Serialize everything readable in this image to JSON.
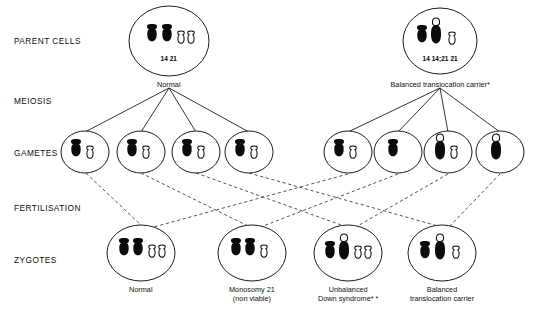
{
  "diagram": {
    "row_labels": [
      {
        "id": "parent-cells",
        "text": "PARENT CELLS",
        "x": 14,
        "y": 36
      },
      {
        "id": "meiosis",
        "text": "MEIOSIS",
        "x": 14,
        "y": 96
      },
      {
        "id": "gametes",
        "text": "GAMETES",
        "x": 14,
        "y": 148
      },
      {
        "id": "fertilisation",
        "text": "FERTILISATION",
        "x": 14,
        "y": 203
      },
      {
        "id": "zygotes",
        "text": "ZYGOTES",
        "x": 14,
        "y": 255
      }
    ],
    "parent_cells": [
      {
        "id": "parent-normal",
        "cx": 169,
        "cy": 41,
        "rx": 40,
        "ry": 35,
        "caption": "Normal",
        "caption_x": 169,
        "caption_y": 80,
        "chromosome_label": "14      21",
        "label_x": 169,
        "label_y": 55,
        "chromosomes": [
          {
            "type": "filled-14",
            "x": 152,
            "y": 24
          },
          {
            "type": "filled-14",
            "x": 167,
            "y": 24
          },
          {
            "type": "open-21",
            "x": 181,
            "y": 31
          },
          {
            "type": "open-21",
            "x": 191,
            "y": 31
          }
        ]
      },
      {
        "id": "parent-translocation-carrier",
        "cx": 440,
        "cy": 41,
        "rx": 37,
        "ry": 33,
        "caption": "Balanced translocation carrier*",
        "caption_x": 440,
        "caption_y": 80,
        "chromosome_label": "14 14;21 21",
        "label_x": 440,
        "label_y": 55,
        "chromosomes": [
          {
            "type": "filled-14",
            "x": 422,
            "y": 25
          },
          {
            "type": "translocation",
            "x": 436,
            "y": 18
          },
          {
            "type": "open-21",
            "x": 452,
            "y": 32
          }
        ]
      }
    ],
    "gametes": [
      {
        "id": "gamete-1",
        "cx": 85,
        "cy": 152,
        "rx": 24,
        "ry": 21,
        "chromosomes": [
          {
            "type": "filled-14",
            "x": 76,
            "y": 139
          },
          {
            "type": "open-21",
            "x": 90,
            "y": 146
          }
        ]
      },
      {
        "id": "gamete-2",
        "cx": 141,
        "cy": 152,
        "rx": 24,
        "ry": 21,
        "chromosomes": [
          {
            "type": "filled-14",
            "x": 132,
            "y": 139
          },
          {
            "type": "open-21",
            "x": 146,
            "y": 146
          }
        ]
      },
      {
        "id": "gamete-3",
        "cx": 196,
        "cy": 152,
        "rx": 24,
        "ry": 21,
        "chromosomes": [
          {
            "type": "filled-14",
            "x": 187,
            "y": 139
          },
          {
            "type": "open-21",
            "x": 201,
            "y": 146
          }
        ]
      },
      {
        "id": "gamete-4",
        "cx": 249,
        "cy": 152,
        "rx": 24,
        "ry": 21,
        "chromosomes": [
          {
            "type": "filled-14",
            "x": 240,
            "y": 139
          },
          {
            "type": "open-21",
            "x": 254,
            "y": 146
          }
        ]
      },
      {
        "id": "gamete-5",
        "cx": 348,
        "cy": 152,
        "rx": 24,
        "ry": 21,
        "chromosomes": [
          {
            "type": "filled-14",
            "x": 339,
            "y": 139
          },
          {
            "type": "open-21",
            "x": 353,
            "y": 146
          }
        ]
      },
      {
        "id": "gamete-6",
        "cx": 398,
        "cy": 152,
        "rx": 24,
        "ry": 21,
        "chromosomes": [
          {
            "type": "filled-14",
            "x": 393,
            "y": 139
          }
        ]
      },
      {
        "id": "gamete-7",
        "cx": 448,
        "cy": 152,
        "rx": 24,
        "ry": 21,
        "chromosomes": [
          {
            "type": "translocation",
            "x": 440,
            "y": 134
          },
          {
            "type": "open-21",
            "x": 454,
            "y": 146
          }
        ]
      },
      {
        "id": "gamete-8",
        "cx": 500,
        "cy": 152,
        "rx": 24,
        "ry": 21,
        "chromosomes": [
          {
            "type": "translocation",
            "x": 496,
            "y": 134
          }
        ]
      }
    ],
    "zygotes": [
      {
        "id": "zygote-normal",
        "cx": 141,
        "cy": 253,
        "rx": 34,
        "ry": 28,
        "caption": "Normal",
        "caption_x": 141,
        "caption_y": 285,
        "chromosomes": [
          {
            "type": "filled-14",
            "x": 124,
            "y": 238
          },
          {
            "type": "filled-14",
            "x": 138,
            "y": 238
          },
          {
            "type": "open-21",
            "x": 152,
            "y": 245
          },
          {
            "type": "open-21",
            "x": 162,
            "y": 245
          }
        ]
      },
      {
        "id": "zygote-monosomy-21",
        "cx": 252,
        "cy": 253,
        "rx": 34,
        "ry": 28,
        "caption": "Monosomy 21\n(non viable)",
        "caption_x": 252,
        "caption_y": 285,
        "chromosomes": [
          {
            "type": "filled-14",
            "x": 236,
            "y": 238
          },
          {
            "type": "filled-14",
            "x": 250,
            "y": 238
          },
          {
            "type": "open-21",
            "x": 264,
            "y": 245
          }
        ]
      },
      {
        "id": "zygote-unbalanced-down",
        "cx": 348,
        "cy": 253,
        "rx": 34,
        "ry": 28,
        "caption": "Unbalanced\nDown syndrome*  *",
        "caption_x": 348,
        "caption_y": 285,
        "chromosomes": [
          {
            "type": "filled-14",
            "x": 330,
            "y": 241
          },
          {
            "type": "translocation",
            "x": 344,
            "y": 234
          },
          {
            "type": "open-21",
            "x": 358,
            "y": 246
          },
          {
            "type": "open-21",
            "x": 368,
            "y": 246
          }
        ]
      },
      {
        "id": "zygote-balanced-carrier",
        "cx": 442,
        "cy": 253,
        "rx": 34,
        "ry": 28,
        "caption": "Balanced\ntranslocation carrier",
        "caption_x": 442,
        "caption_y": 285,
        "chromosomes": [
          {
            "type": "filled-14",
            "x": 425,
            "y": 241
          },
          {
            "type": "translocation",
            "x": 440,
            "y": 234
          },
          {
            "type": "open-21",
            "x": 456,
            "y": 246
          }
        ]
      }
    ],
    "meiosis_lines": [
      {
        "from": [
          169,
          88
        ],
        "to": [
          85,
          132
        ]
      },
      {
        "from": [
          169,
          88
        ],
        "to": [
          141,
          132
        ]
      },
      {
        "from": [
          169,
          88
        ],
        "to": [
          196,
          132
        ]
      },
      {
        "from": [
          169,
          88
        ],
        "to": [
          249,
          132
        ]
      },
      {
        "from": [
          440,
          88
        ],
        "to": [
          348,
          132
        ]
      },
      {
        "from": [
          440,
          88
        ],
        "to": [
          398,
          132
        ]
      },
      {
        "from": [
          440,
          88
        ],
        "to": [
          448,
          132
        ]
      },
      {
        "from": [
          440,
          88
        ],
        "to": [
          500,
          132
        ]
      }
    ],
    "fertilisation_lines": [
      {
        "from": [
          86,
          173
        ],
        "to": [
          142,
          226
        ],
        "pair": "gamete-1-to-zygote-normal"
      },
      {
        "from": [
          348,
          174
        ],
        "to": [
          150,
          228
        ],
        "pair": "gamete-5-to-zygote-normal"
      },
      {
        "from": [
          141,
          173
        ],
        "to": [
          248,
          226
        ],
        "pair": "gamete-2-to-zygote-monosomy"
      },
      {
        "from": [
          398,
          174
        ],
        "to": [
          258,
          228
        ],
        "pair": "gamete-6-to-zygote-monosomy"
      },
      {
        "from": [
          196,
          173
        ],
        "to": [
          344,
          226
        ],
        "pair": "gamete-3-to-zygote-down"
      },
      {
        "from": [
          448,
          174
        ],
        "to": [
          354,
          228
        ],
        "pair": "gamete-7-to-zygote-down"
      },
      {
        "from": [
          249,
          173
        ],
        "to": [
          438,
          226
        ],
        "pair": "gamete-4-to-zygote-balanced"
      },
      {
        "from": [
          500,
          174
        ],
        "to": [
          448,
          228
        ],
        "pair": "gamete-8-to-zygote-balanced"
      }
    ],
    "chromosome_legend": {
      "filled-14": "chromosome 14 (solid black)",
      "open-21": "chromosome 21 (outline)",
      "translocation": "translocation chromosome 14;21"
    }
  }
}
